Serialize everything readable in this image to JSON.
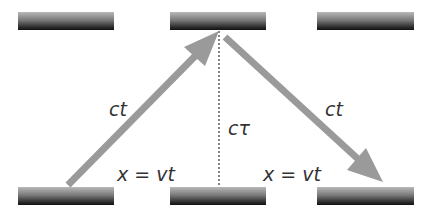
{
  "labels": {
    "left_path": "ct",
    "right_path": "ct",
    "proper_time": "cτ",
    "left_displacement": "x = vt",
    "right_displacement": "x = vt"
  },
  "colors": {
    "arrow": "#9a9a9a",
    "mirror_dark": "#111111",
    "mirror_light": "#b8b8b8",
    "text": "#333333"
  },
  "mirrors": {
    "top": [
      "left",
      "center",
      "right"
    ],
    "bottom": [
      "left",
      "center",
      "right"
    ]
  }
}
